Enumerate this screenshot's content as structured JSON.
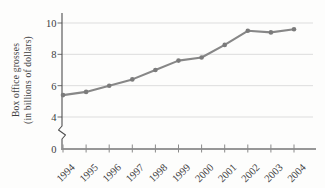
{
  "chart_data": {
    "type": "line",
    "title": "",
    "xlabel": "",
    "ylabel": "Box office grosses (in billions of dollars)",
    "ylabel_line1": "Box office grosses",
    "ylabel_line2": "(in billions of dollars)",
    "categories": [
      "1994",
      "1995",
      "1996",
      "1997",
      "1998",
      "1999",
      "2000",
      "2001",
      "2002",
      "2003",
      "2004"
    ],
    "values": [
      5.4,
      5.6,
      6.0,
      6.4,
      7.0,
      7.6,
      7.8,
      8.6,
      9.5,
      9.4,
      9.6
    ],
    "y_tick_values": [
      0,
      4,
      6,
      8,
      10
    ],
    "ylim": [
      0,
      10
    ],
    "y_axis_break": "between 0 and 4",
    "grid": "horizontal gridlines at 4, 6, 8, 10",
    "legend": "none",
    "marker": "filled-circle",
    "colors": {
      "line": "#878787",
      "marker": "#7b7b7b",
      "grid": "#dddddd",
      "x_axis": "#979797",
      "y_axis": "#4f4f4f",
      "tick": "#8a8a8a",
      "text": "#3c3c3c",
      "background": "#fdfdfc"
    }
  }
}
